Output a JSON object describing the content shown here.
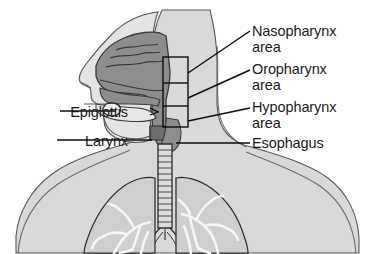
{
  "figure": {
    "background_color": "#ffffff"
  },
  "colors": {
    "outline": "#3a3a3a",
    "body_fill": "#d9d9d9",
    "lung_fill": "#cfcfcf",
    "airway_fill": "#8d8d8d",
    "airway_fill_dark": "#6e6e6e",
    "mouth_fill": "#e8e8e8",
    "bronchi_fill": "#f2f2f2",
    "label_color": "#1a1a1a",
    "leader_line": "#111111"
  },
  "labels": {
    "nasopharynx": {
      "line1": "Nasopharynx",
      "line2": "area"
    },
    "oropharynx": {
      "line1": "Oropharynx",
      "line2": "area"
    },
    "hypopharynx": {
      "line1": "Hypopharynx",
      "line2": "area"
    },
    "esophagus": {
      "line1": "Esophagus"
    },
    "epiglottis": {
      "line1": "Epiglottis"
    },
    "larynx": {
      "line1": "Larynx"
    }
  },
  "annotations": {
    "bracket_box": {
      "description": "rectangle divided into three stacked regions marking nasopharynx, oropharynx and hypopharynx",
      "segments": 3
    },
    "leader_lines": 6
  }
}
